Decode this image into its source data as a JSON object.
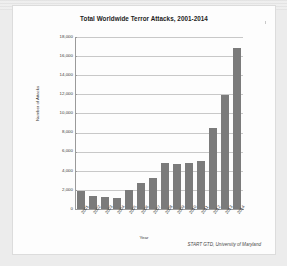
{
  "document": {
    "source_note": "START GTD, University of Maryland"
  },
  "chart_data": {
    "type": "bar",
    "title": "Total Worldwide Terror Attacks, 2001-2014",
    "xlabel": "Year",
    "ylabel": "Number of Attacks",
    "categories": [
      "2001",
      "2002",
      "2003",
      "2004",
      "2005",
      "2006",
      "2007",
      "2008",
      "2009",
      "2010",
      "2011",
      "2012",
      "2013",
      "2014"
    ],
    "values": [
      1880,
      1330,
      1260,
      1160,
      2020,
      2750,
      3240,
      4800,
      4730,
      4790,
      5070,
      8500,
      11950,
      16800
    ],
    "ylim": [
      0,
      18000
    ],
    "ytick_labels": [
      "0",
      "2,000",
      "4,000",
      "6,000",
      "8,000",
      "10,000",
      "12,000",
      "14,000",
      "16,000",
      "18,000"
    ],
    "ytick_values": [
      0,
      2000,
      4000,
      6000,
      8000,
      10000,
      12000,
      14000,
      16000,
      18000
    ],
    "grid": true,
    "legend": false,
    "bar_color": "#7b7b7b",
    "grid_color": "#c8c8c8",
    "axis_color": "#9a9a9a"
  }
}
